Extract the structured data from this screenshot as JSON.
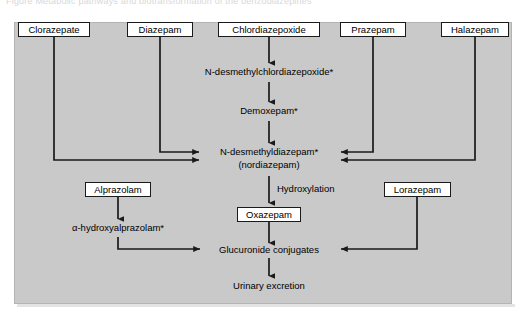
{
  "figure": {
    "top_caption": "Figure  Metabolic pathways and biotransformation of the benzodiazepines",
    "background_color": "#c9c9c9",
    "line_color": "#1a1a1a",
    "box_fill": "#ffffff"
  },
  "nodes": {
    "clorazepate": {
      "label": "Clorazepate",
      "type": "boxed"
    },
    "diazepam": {
      "label": "Diazepam",
      "type": "boxed"
    },
    "chlordiazepoxide": {
      "label": "Chlordiazepoxide",
      "type": "boxed"
    },
    "prazepam": {
      "label": "Prazepam",
      "type": "boxed"
    },
    "halazepam": {
      "label": "Halazepam",
      "type": "boxed"
    },
    "alprazolam": {
      "label": "Alprazolam",
      "type": "boxed"
    },
    "lorazepam": {
      "label": "Lorazepam",
      "type": "boxed"
    },
    "oxazepam": {
      "label": "Oxazepam",
      "type": "boxed"
    },
    "n_desmethylchlordiazepoxide": {
      "label": "N-desmethylchlordiazepoxide*",
      "type": "plain"
    },
    "demoxepam": {
      "label": "Demoxepam*",
      "type": "plain"
    },
    "n_desmethyldiazepam": {
      "label": "N-desmethyldiazepam*",
      "type": "plain"
    },
    "nordiazepam": {
      "label": "(nordiazepam)",
      "type": "plain"
    },
    "alpha_hydroxyalprazolam": {
      "label": "α-hydroxyalprazolam*",
      "type": "plain"
    },
    "glucuronide_conjugates": {
      "label": "Glucuronide conjugates",
      "type": "plain"
    },
    "urinary_excretion": {
      "label": "Urinary excretion",
      "type": "plain"
    }
  },
  "edge_labels": {
    "hydroxylation": "Hydroxylation"
  },
  "edges": [
    {
      "from": "chlordiazepoxide",
      "to": "n_desmethylchlordiazepoxide"
    },
    {
      "from": "n_desmethylchlordiazepoxide",
      "to": "demoxepam"
    },
    {
      "from": "demoxepam",
      "to": "n_desmethyldiazepam"
    },
    {
      "from": "diazepam",
      "to": "n_desmethyldiazepam"
    },
    {
      "from": "clorazepate",
      "to": "n_desmethyldiazepam"
    },
    {
      "from": "prazepam",
      "to": "n_desmethyldiazepam"
    },
    {
      "from": "halazepam",
      "to": "n_desmethyldiazepam"
    },
    {
      "from": "n_desmethyldiazepam",
      "to": "oxazepam",
      "label": "Hydroxylation"
    },
    {
      "from": "oxazepam",
      "to": "glucuronide_conjugates"
    },
    {
      "from": "alprazolam",
      "to": "alpha_hydroxyalprazolam"
    },
    {
      "from": "alpha_hydroxyalprazolam",
      "to": "glucuronide_conjugates"
    },
    {
      "from": "lorazepam",
      "to": "glucuronide_conjugates"
    },
    {
      "from": "glucuronide_conjugates",
      "to": "urinary_excretion"
    }
  ]
}
